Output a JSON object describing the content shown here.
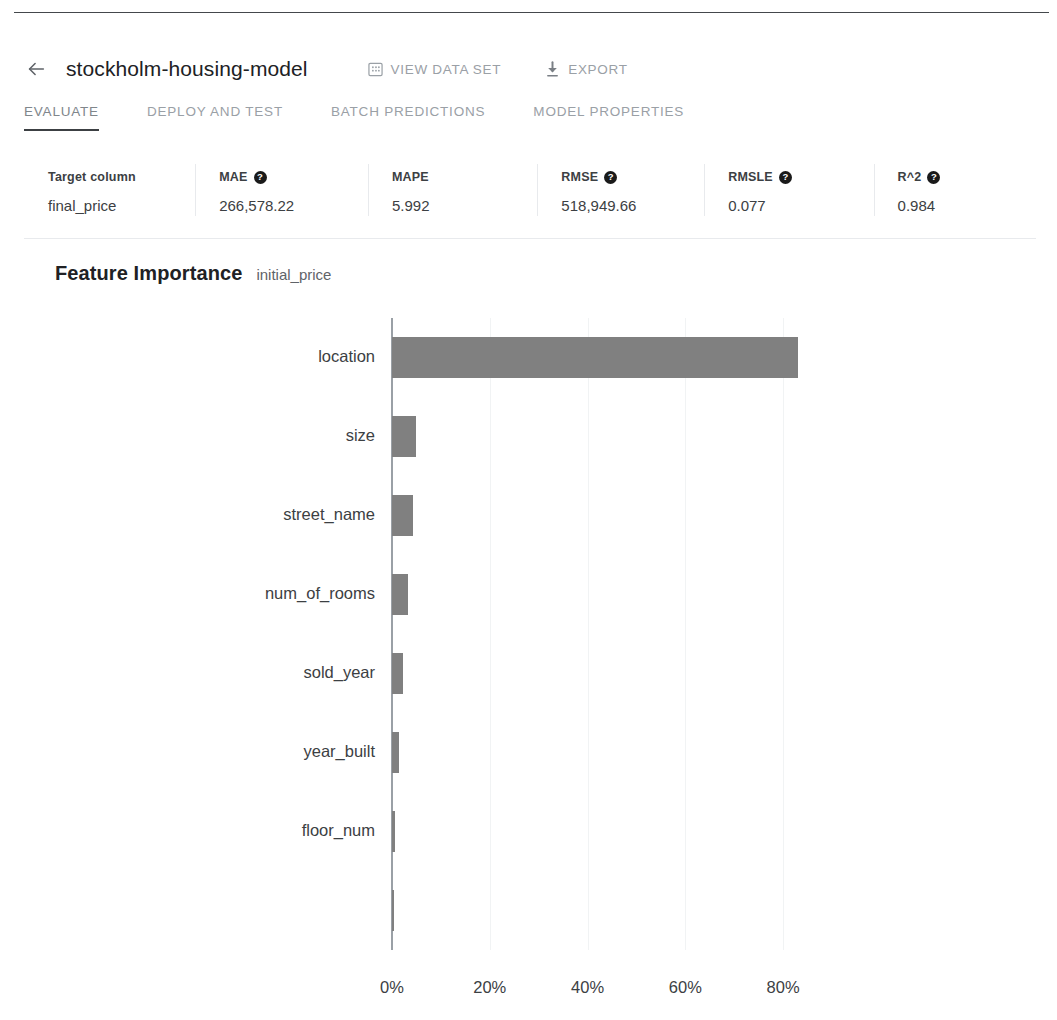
{
  "header": {
    "back_icon": "arrow-left-icon",
    "title": "stockholm-housing-model",
    "actions": [
      {
        "icon": "data-set-icon",
        "label": "VIEW DATA SET"
      },
      {
        "icon": "download-icon",
        "label": "EXPORT"
      }
    ]
  },
  "tabs": [
    {
      "label": "EVALUATE",
      "active": true
    },
    {
      "label": "DEPLOY AND TEST",
      "active": false
    },
    {
      "label": "BATCH PREDICTIONS",
      "active": false
    },
    {
      "label": "MODEL PROPERTIES",
      "active": false
    }
  ],
  "metrics": {
    "columns": [
      {
        "header": "Target column",
        "help": false,
        "value": "final_price"
      },
      {
        "header": "MAE",
        "help": true,
        "value": "266,578.22"
      },
      {
        "header": "MAPE",
        "help": false,
        "value": "5.992"
      },
      {
        "header": "RMSE",
        "help": true,
        "value": "518,949.66"
      },
      {
        "header": "RMSLE",
        "help": true,
        "value": "0.077"
      },
      {
        "header": "R^2",
        "help": true,
        "value": "0.984"
      }
    ],
    "help_glyph": "?"
  },
  "feature_importance": {
    "title": "Feature Importance",
    "subtitle": "initial_price"
  },
  "chart_data": {
    "type": "bar",
    "orientation": "horizontal",
    "title": "Feature Importance",
    "subtitle": "initial_price",
    "xlabel": "",
    "ylabel": "",
    "xlim": [
      0,
      90
    ],
    "grid": true,
    "grid_axis": "x",
    "bar_color": "#808080",
    "tick_labels": [
      "0%",
      "20%",
      "40%",
      "60%",
      "80%"
    ],
    "tick_values": [
      0,
      20,
      40,
      60,
      80
    ],
    "categories": [
      "location",
      "size",
      "street_name",
      "num_of_rooms",
      "sold_year",
      "year_built",
      "floor_num",
      ""
    ],
    "values": [
      83.0,
      5.0,
      4.2,
      3.2,
      2.2,
      1.4,
      0.7,
      0.3
    ]
  }
}
